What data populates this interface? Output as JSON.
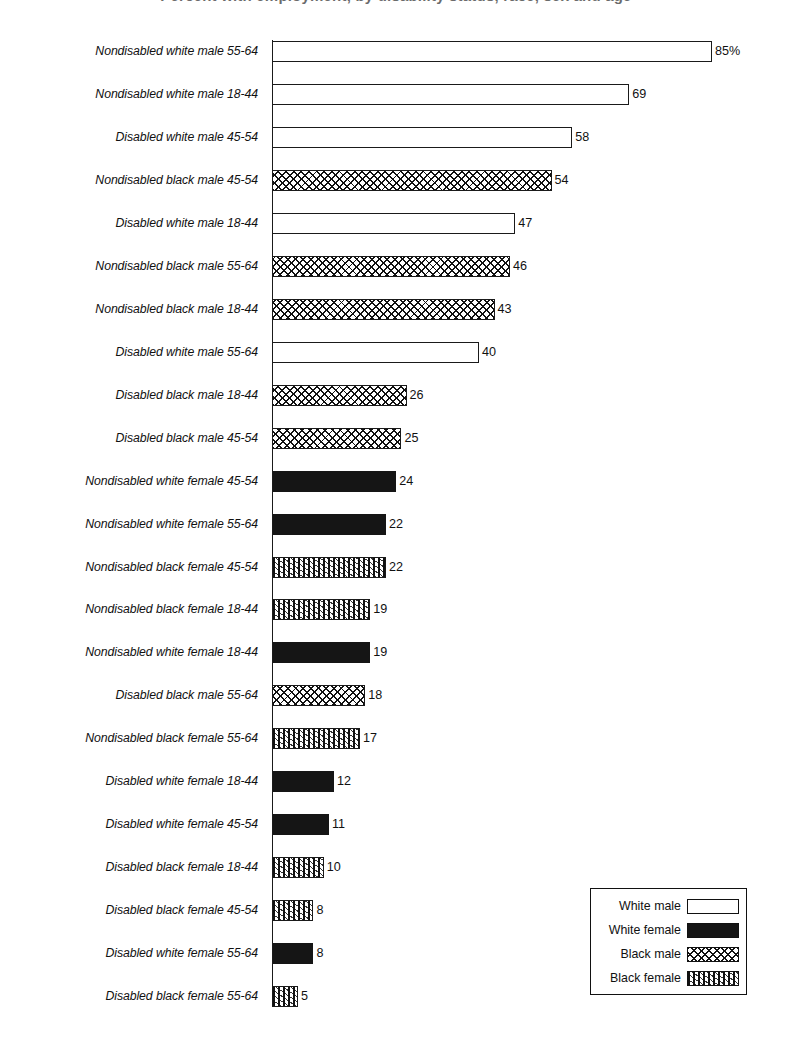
{
  "chart_data": {
    "type": "bar",
    "orientation": "horizontal",
    "title": "Percent with employment, by disability status, race, sex and age",
    "xlabel": "",
    "ylabel": "",
    "value_suffix_first": "%",
    "xlim": [
      0,
      85
    ],
    "grid": false,
    "legend_position": "bottom-right",
    "categories": [
      "Nondisabled white male 55-64",
      "Nondisabled white male 18-44",
      "Disabled white male 45-54",
      "Nondisabled black male 45-54",
      "Disabled white male 18-44",
      "Nondisabled black male 55-64",
      "Nondisabled black male 18-44",
      "Disabled white male 55-64",
      "Disabled black male 18-44",
      "Disabled black male 45-54",
      "Nondisabled white female 45-54",
      "Nondisabled white female 55-64",
      "Nondisabled black female 45-54",
      "Nondisabled black female 18-44",
      "Nondisabled white female 18-44",
      "Disabled black male 55-64",
      "Nondisabled black female 55-64",
      "Disabled white female 18-44",
      "Disabled white female 45-54",
      "Disabled black female 18-44",
      "Disabled black female 45-54",
      "Disabled white female 55-64",
      "Disabled black female 55-64"
    ],
    "values": [
      85,
      69,
      58,
      54,
      47,
      46,
      43,
      40,
      26,
      25,
      24,
      22,
      22,
      19,
      19,
      18,
      17,
      12,
      11,
      10,
      8,
      8,
      5
    ],
    "value_labels": [
      "85%",
      "69",
      "58",
      "54",
      "47",
      "46",
      "43",
      "40",
      "26",
      "25",
      "24",
      "22",
      "22",
      "19",
      "19",
      "18",
      "17",
      "12",
      "11",
      "10",
      "8",
      "8",
      "5"
    ],
    "group_keys": [
      "white-male",
      "white-male",
      "white-male",
      "black-male",
      "white-male",
      "black-male",
      "black-male",
      "white-male",
      "black-male",
      "black-male",
      "white-female",
      "white-female",
      "black-female",
      "black-female",
      "white-female",
      "black-male",
      "black-female",
      "white-female",
      "white-female",
      "black-female",
      "black-female",
      "white-female",
      "black-female"
    ],
    "legend": [
      {
        "key": "white-male",
        "label": "White male"
      },
      {
        "key": "white-female",
        "label": "White female"
      },
      {
        "key": "black-male",
        "label": "Black male"
      },
      {
        "key": "black-female",
        "label": "Black female"
      }
    ]
  }
}
